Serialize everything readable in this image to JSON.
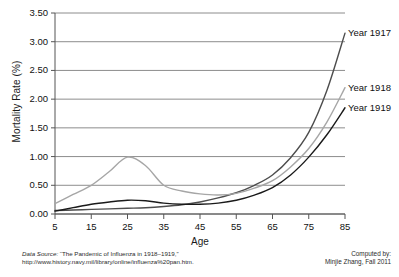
{
  "chart_data": {
    "type": "line",
    "title": "",
    "xlabel": "Age",
    "ylabel": "Mortality Rate (%)",
    "xlim": [
      5,
      85
    ],
    "ylim": [
      0.0,
      3.5
    ],
    "xticks": [
      5,
      15,
      25,
      35,
      45,
      55,
      65,
      75,
      85
    ],
    "xtick_labels": [
      "5",
      "15",
      "25",
      "35",
      "45",
      "55",
      "65",
      "75",
      "85"
    ],
    "yticks": [
      0.0,
      0.5,
      1.0,
      1.5,
      2.0,
      2.5,
      3.0,
      3.5
    ],
    "ytick_labels": [
      "0.00",
      "0.50",
      "1.00",
      "1.50",
      "2.00",
      "2.50",
      "3.00",
      "3.50"
    ],
    "grid": "horizontal",
    "legend_position": "right-inline-labels",
    "x": [
      5,
      10,
      15,
      20,
      25,
      30,
      35,
      40,
      45,
      50,
      55,
      60,
      65,
      70,
      75,
      80,
      85
    ],
    "series": [
      {
        "name": "Year 1917",
        "color": "#4d4d4d",
        "values": [
          0.06,
          0.07,
          0.08,
          0.09,
          0.1,
          0.11,
          0.13,
          0.16,
          0.21,
          0.28,
          0.37,
          0.5,
          0.68,
          0.98,
          1.42,
          2.15,
          3.15
        ]
      },
      {
        "name": "Year 1918",
        "color": "#a6a6a6",
        "values": [
          0.18,
          0.34,
          0.5,
          0.74,
          0.99,
          0.84,
          0.5,
          0.4,
          0.35,
          0.33,
          0.36,
          0.45,
          0.58,
          0.82,
          1.14,
          1.6,
          2.2
        ]
      },
      {
        "name": "Year 1919",
        "color": "#1a1a1a",
        "values": [
          0.05,
          0.11,
          0.17,
          0.21,
          0.24,
          0.23,
          0.19,
          0.17,
          0.17,
          0.19,
          0.24,
          0.33,
          0.46,
          0.68,
          0.99,
          1.38,
          1.85
        ]
      }
    ],
    "annotations": [
      {
        "text": "Year 1917",
        "series": "Year 1917"
      },
      {
        "text": "Year 1918",
        "series": "Year 1918"
      },
      {
        "text": "Year 1919",
        "series": "Year 1919"
      }
    ]
  },
  "footer": {
    "source_prefix": "Data Source:",
    "source_title": "“The Pandemic of Influenza in 1918–1919,”",
    "source_url": "http://www.history.navy.mil/library/online/influenza%20pan.htm.",
    "credit_line1": "Computed by:",
    "credit_line2": "Minjie Zhang, Fall 2011"
  }
}
